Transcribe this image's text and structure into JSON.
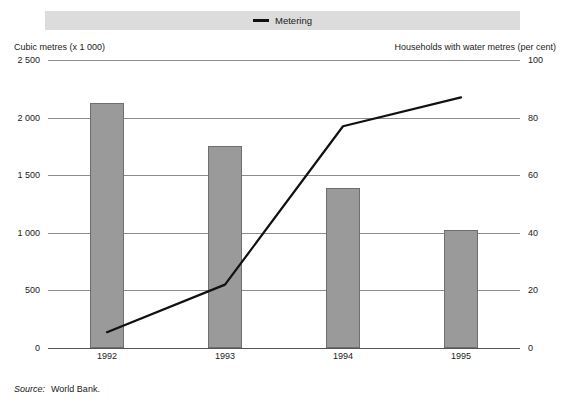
{
  "legend": {
    "marker": "line-marker-icon",
    "label": "Metering"
  },
  "axes": {
    "left_caption": "Cubic metres (x 1 000)",
    "right_caption": "Households with water metres (per cent)"
  },
  "source": {
    "label": "Source:",
    "value": "World Bank."
  },
  "chart_data": {
    "type": "bar",
    "title": "",
    "subtitle": "",
    "categories": [
      "1992",
      "1993",
      "1994",
      "1995"
    ],
    "xlabel": "",
    "grid": true,
    "legend_position": "top",
    "series": [
      {
        "name": "Cubic metres (x 1 000)",
        "type": "bar",
        "axis": "left",
        "color": "#9a9a9a",
        "values": [
          2130,
          1750,
          1390,
          1020
        ]
      },
      {
        "name": "Metering",
        "type": "line",
        "axis": "right",
        "color": "#111111",
        "values": [
          5.5,
          22,
          77,
          87
        ]
      }
    ],
    "left_axis": {
      "label": "Cubic metres (x 1 000)",
      "ylim": [
        0,
        2500
      ],
      "ticks": [
        0,
        500,
        1000,
        1500,
        2000,
        2500
      ],
      "ticklabels": [
        "0",
        "500",
        "1 000",
        "1 500",
        "2 000",
        "2 500"
      ]
    },
    "right_axis": {
      "label": "Households with water metres (per cent)",
      "ylim": [
        0,
        100
      ],
      "ticks": [
        0,
        20,
        40,
        60,
        80,
        100
      ],
      "ticklabels": [
        "0",
        "20",
        "40",
        "60",
        "80",
        "100"
      ]
    }
  }
}
